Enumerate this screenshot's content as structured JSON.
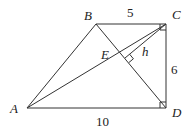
{
  "diagram": {
    "type": "trapezoid-geometry",
    "points": {
      "A": {
        "label": "A",
        "x": 27,
        "y": 108
      },
      "B": {
        "label": "B",
        "x": 96,
        "y": 24
      },
      "C": {
        "label": "C",
        "x": 166,
        "y": 24
      },
      "D": {
        "label": "D",
        "x": 166,
        "y": 108
      },
      "E": {
        "label": "E"
      },
      "F": {
        "x": 125,
        "y": 58
      }
    },
    "lengths": {
      "BC": "5",
      "CD": "6",
      "AD": "10"
    },
    "height_label": "h",
    "right_angles": [
      "C",
      "D",
      "foot-of-h"
    ]
  }
}
